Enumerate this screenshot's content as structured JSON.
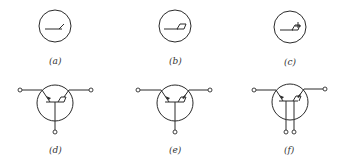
{
  "diagram": {
    "panels": [
      {
        "id": "a",
        "label": "(a)",
        "symbol": "circle with horizontal base line and single angled contact"
      },
      {
        "id": "b",
        "label": "(b)",
        "symbol": "circle with horizontal base line and parallelogram contact"
      },
      {
        "id": "c",
        "label": "(c)",
        "symbol": "circle with horizontal base line and contact with arrow"
      },
      {
        "id": "d",
        "label": "(d)",
        "symbol": "three-terminal transistor, emitter arrow left, collector right, base bottom"
      },
      {
        "id": "e",
        "label": "(e)",
        "symbol": "three-terminal transistor, arrows on both emitter and collector"
      },
      {
        "id": "f",
        "label": "(f)",
        "symbol": "four-terminal transistor with two base leads"
      }
    ]
  }
}
